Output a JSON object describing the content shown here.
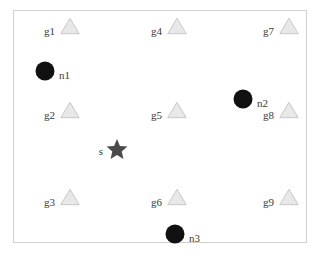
{
  "figure": {
    "background_color": "#ffffff",
    "frame": {
      "x": 13,
      "y": 10,
      "width": 294,
      "height": 233,
      "border_color": "#cfcfcf"
    }
  },
  "style": {
    "triangle_fill": "#e8e8e8",
    "triangle_stroke": "#c8c8c8",
    "circle_fill": "#111111",
    "star_fill": "#4a4a4a",
    "label_color": "#3a3a3a",
    "label_font_size": "11px"
  },
  "chart_data": {
    "type": "scatter",
    "title": "",
    "xlabel": "",
    "ylabel": "",
    "grid": false,
    "legend": null,
    "axis_ticks": false,
    "series": [
      {
        "name": "gateways",
        "marker": "triangle",
        "color": "#e8e8e8",
        "label_side": "left",
        "points": [
          {
            "label": "g1",
            "x": 70,
            "y": 26
          },
          {
            "label": "g2",
            "x": 70,
            "y": 110
          },
          {
            "label": "g3",
            "x": 70,
            "y": 197
          },
          {
            "label": "g4",
            "x": 177,
            "y": 26
          },
          {
            "label": "g5",
            "x": 177,
            "y": 110
          },
          {
            "label": "g6",
            "x": 177,
            "y": 197
          },
          {
            "label": "g7",
            "x": 289,
            "y": 26
          },
          {
            "label": "g8",
            "x": 289,
            "y": 110
          },
          {
            "label": "g9",
            "x": 289,
            "y": 197
          }
        ]
      },
      {
        "name": "nodes",
        "marker": "circle",
        "color": "#111111",
        "label_side": "right",
        "points": [
          {
            "label": "n1",
            "x": 45,
            "y": 71
          },
          {
            "label": "n2",
            "x": 243,
            "y": 99
          },
          {
            "label": "n3",
            "x": 175,
            "y": 234
          }
        ]
      },
      {
        "name": "source",
        "marker": "star",
        "color": "#4a4a4a",
        "label_side": "left",
        "points": [
          {
            "label": "s",
            "x": 117,
            "y": 150
          }
        ]
      }
    ]
  }
}
